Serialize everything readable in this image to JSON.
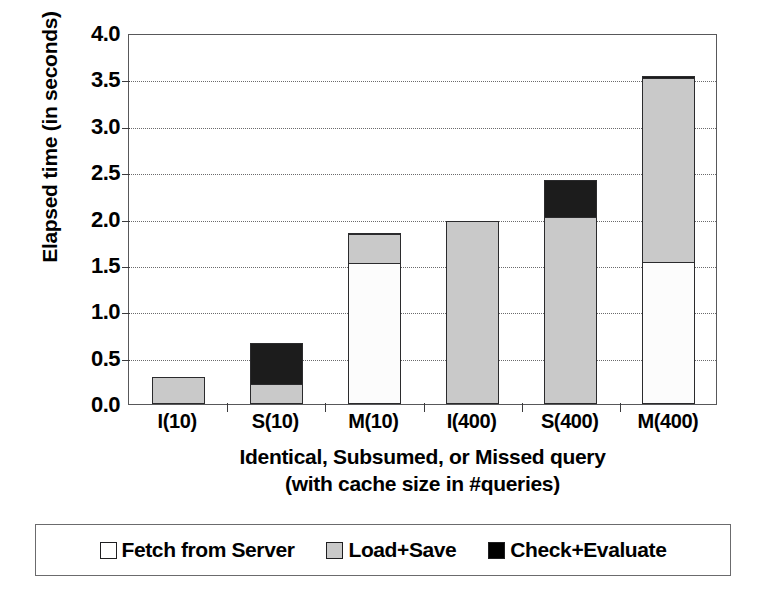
{
  "chart_data": {
    "type": "bar",
    "stacked": true,
    "title": "",
    "xlabel": "Identical, Subsumed, or Missed query (with cache size in #queries)",
    "xlabel_line1": "Identical, Subsumed, or Missed query",
    "xlabel_line2": "(with cache size in #queries)",
    "ylabel": "Elapsed time (in seconds)",
    "ylim": [
      0.0,
      4.0
    ],
    "ytick_step": 0.5,
    "yticks": [
      "0.0",
      "0.5",
      "1.0",
      "1.5",
      "2.0",
      "2.5",
      "3.0",
      "3.5",
      "4.0"
    ],
    "ytick_values": [
      0.0,
      0.5,
      1.0,
      1.5,
      2.0,
      2.5,
      3.0,
      3.5,
      4.0
    ],
    "grid": true,
    "grid_axis": "y",
    "grid_style": "dotted",
    "legend_position": "bottom",
    "categories": [
      "I(10)",
      "S(10)",
      "M(10)",
      "I(400)",
      "S(400)",
      "M(400)"
    ],
    "series": [
      {
        "name": "Fetch from Server",
        "color": "#ffffff",
        "values": [
          0.0,
          0.0,
          1.52,
          0.0,
          0.0,
          1.53
        ]
      },
      {
        "name": "Load+Save",
        "color": "#c9c9c9",
        "values": [
          0.29,
          0.22,
          0.33,
          1.97,
          2.02,
          2.0
        ]
      },
      {
        "name": "Check+Evaluate",
        "color": "#000000",
        "values": [
          0.0,
          0.46,
          0.03,
          0.02,
          0.41,
          0.04
        ]
      }
    ],
    "totals": [
      0.29,
      0.68,
      1.88,
      1.99,
      2.43,
      3.57
    ]
  },
  "legend": {
    "items": [
      {
        "label": "Fetch from Server",
        "color": "#ffffff",
        "swatch_name": "legend-swatch-fetch"
      },
      {
        "label": "Load+Save",
        "color": "#c9c9c9",
        "swatch_name": "legend-swatch-load"
      },
      {
        "label": "Check+Evaluate",
        "color": "#000000",
        "swatch_name": "legend-swatch-check"
      }
    ]
  }
}
